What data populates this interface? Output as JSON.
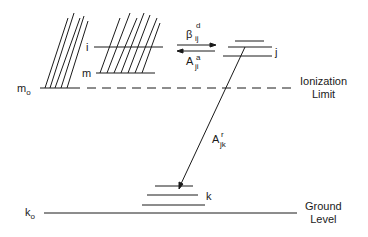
{
  "diagram": {
    "type": "energy-level diagram",
    "levels": {
      "m0": {
        "label": "m",
        "sub": "o"
      },
      "i": {
        "label": "i"
      },
      "m": {
        "label": "m"
      },
      "j": {
        "label": "j"
      },
      "k": {
        "label": "k"
      },
      "k0": {
        "label": "k",
        "sub": "o"
      }
    },
    "transitions": {
      "dielectronic_capture": {
        "symbol": "β",
        "sup": "d",
        "sub": "ij"
      },
      "autoionization": {
        "symbol": "A",
        "sup": "a",
        "sub": "ji"
      },
      "radiative": {
        "symbol": "A",
        "sup": "r",
        "sub": "jk"
      }
    },
    "annotations": {
      "ionization_limit": {
        "line1": "Ionization",
        "line2": "Limit"
      },
      "ground_level": {
        "line1": "Ground",
        "line2": "Level"
      }
    },
    "colors": {
      "ink": "#1a1a1a",
      "background": "#ffffff"
    }
  }
}
